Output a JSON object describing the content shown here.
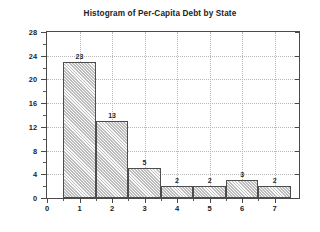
{
  "chart_data": {
    "type": "bar",
    "title": "Histogram of Per-Capita Debt by State",
    "xlabel": "",
    "ylabel": "Count",
    "categories": [
      "1",
      "2",
      "3",
      "4",
      "5",
      "6",
      "7"
    ],
    "values": [
      23,
      13,
      5,
      2,
      2,
      3,
      2
    ],
    "bar_labels": [
      "23",
      "13",
      "5",
      "2",
      "2",
      "3",
      "2"
    ],
    "bin_edges": [
      0.5,
      1.5,
      2.5,
      3.5,
      4.5,
      5.5,
      6.5,
      7.5
    ],
    "xlim": [
      0,
      7.75
    ],
    "ylim": [
      0,
      28
    ],
    "xticks": [
      "0",
      "1",
      "2",
      "3",
      "4",
      "5",
      "6",
      "7"
    ],
    "xtick_values": [
      0,
      1,
      2,
      3,
      4,
      5,
      6,
      7
    ],
    "yticks": [
      "0",
      "4",
      "8",
      "12",
      "16",
      "20",
      "24",
      "28"
    ],
    "ytick_values": [
      0,
      4,
      8,
      12,
      16,
      20,
      24,
      28
    ],
    "grid": true,
    "legend": false,
    "bar_fill_color": "#d6d6d6",
    "bar_edge_color": "#4d4d4d",
    "grid_color": "#b9b9b9",
    "axis_color": "#4a4a4a",
    "background_color": "#ffffff"
  }
}
